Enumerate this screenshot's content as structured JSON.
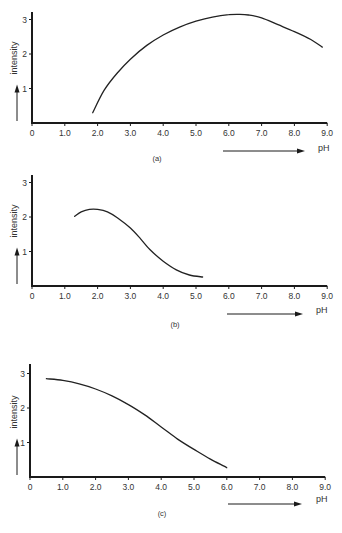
{
  "chart_data": [
    {
      "id": "a",
      "type": "line",
      "caption": "(a)",
      "xlabel": "pH",
      "ylabel": "intensity",
      "xlim": [
        0,
        9.0
      ],
      "ylim": [
        0,
        3.2
      ],
      "x_ticks": [
        "0",
        "1.0",
        "2.0",
        "3.0",
        "4.0",
        "5.0",
        "6.0",
        "7.0",
        "8.0",
        "9.0"
      ],
      "y_ticks": [
        "1",
        "2",
        "3"
      ],
      "grid": false,
      "series": [
        {
          "name": "intensity",
          "x": [
            1.85,
            2.2,
            2.6,
            3.0,
            3.5,
            4.0,
            4.5,
            5.0,
            5.5,
            6.0,
            6.3,
            6.6,
            7.0,
            7.5,
            8.0,
            8.5,
            8.85
          ],
          "y": [
            0.3,
            0.95,
            1.45,
            1.85,
            2.25,
            2.55,
            2.78,
            2.95,
            3.07,
            3.14,
            3.15,
            3.13,
            3.05,
            2.85,
            2.65,
            2.42,
            2.2
          ]
        }
      ]
    },
    {
      "id": "b",
      "type": "line",
      "caption": "(b)",
      "xlabel": "pH",
      "ylabel": "intensity",
      "xlim": [
        0,
        9.0
      ],
      "ylim": [
        0,
        3.2
      ],
      "x_ticks": [
        "0",
        "1.0",
        "2.0",
        "3.0",
        "4.0",
        "5.0",
        "6.0",
        "7.0",
        "8.0",
        "9.0"
      ],
      "y_ticks": [
        "1",
        "2",
        "3"
      ],
      "grid": false,
      "series": [
        {
          "name": "intensity",
          "x": [
            1.3,
            1.5,
            1.75,
            2.0,
            2.3,
            2.6,
            3.0,
            3.3,
            3.6,
            4.0,
            4.4,
            4.8,
            5.2
          ],
          "y": [
            2.02,
            2.15,
            2.22,
            2.22,
            2.15,
            1.98,
            1.68,
            1.38,
            1.05,
            0.72,
            0.47,
            0.32,
            0.26
          ]
        }
      ]
    },
    {
      "id": "c",
      "type": "line",
      "caption": "(c)",
      "xlabel": "pH",
      "ylabel": "intensity",
      "xlim": [
        0,
        9.0
      ],
      "ylim": [
        0,
        3.2
      ],
      "x_ticks": [
        "0",
        "1.0",
        "2.0",
        "3.0",
        "4.0",
        "5.0",
        "6.0",
        "7.0",
        "8.0",
        "9.0"
      ],
      "y_ticks": [
        "1",
        "2",
        "3"
      ],
      "grid": false,
      "series": [
        {
          "name": "intensity",
          "x": [
            0.5,
            1.0,
            1.5,
            2.0,
            2.5,
            3.0,
            3.5,
            4.0,
            4.5,
            5.0,
            5.5,
            6.0
          ],
          "y": [
            2.85,
            2.8,
            2.7,
            2.55,
            2.35,
            2.1,
            1.8,
            1.45,
            1.1,
            0.8,
            0.52,
            0.27
          ]
        }
      ]
    }
  ],
  "style": {
    "line_color": "#222222",
    "axis_color": "#1a1a1a",
    "text_color": "#333333"
  }
}
